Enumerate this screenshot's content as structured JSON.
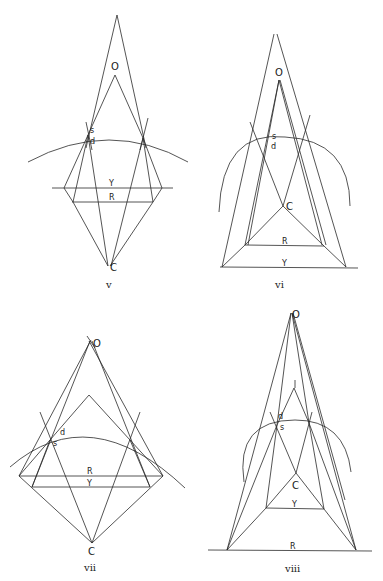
{
  "figures": [
    {
      "id": "v",
      "caption": "v",
      "labels": {
        "O": "O",
        "s": "s",
        "d": "d",
        "Y": "Y",
        "R": "R",
        "C": "C"
      }
    },
    {
      "id": "vi",
      "caption": "vi",
      "labels": {
        "O": "O",
        "s": "s",
        "d": "d",
        "Y": "Y",
        "R": "R",
        "C": "C"
      }
    },
    {
      "id": "vii",
      "caption": "vii",
      "labels": {
        "O": "O",
        "s": "s",
        "d": "d",
        "Y": "Y",
        "R": "R",
        "C": "C"
      }
    },
    {
      "id": "viii",
      "caption": "viii",
      "labels": {
        "O": "O",
        "s": "s",
        "d": "d",
        "Y": "Y",
        "R": "R",
        "C": "C"
      }
    }
  ]
}
